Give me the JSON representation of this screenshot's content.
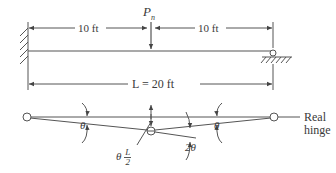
{
  "beam": {
    "load_label": "P",
    "load_subscript": "n",
    "left_span": "10 ft",
    "right_span": "10 ft",
    "total_length": "L = 20 ft",
    "left_support": "fixed-wall",
    "right_support": "roller"
  },
  "mechanism": {
    "left_angle": "θ",
    "right_angle": "θ",
    "center_angle": "2θ",
    "deflection_theta": "θ",
    "deflection_num": "L",
    "deflection_den": "2",
    "hinge_label_line1": "Real",
    "hinge_label_line2": "hinge"
  },
  "colors": {
    "line": "#555555",
    "text": "#3a3a3a"
  }
}
